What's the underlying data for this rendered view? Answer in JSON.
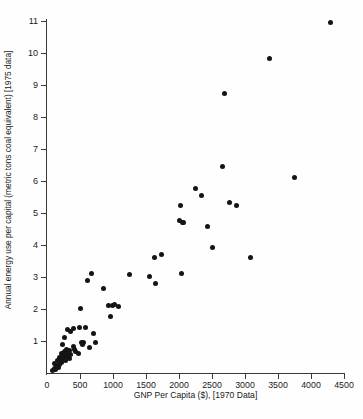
{
  "chart_data": {
    "type": "scatter",
    "title": "",
    "xlabel": "GNP Per Capita ($), [1970 Data]",
    "ylabel": "Annual energy use per capital (metric tons coal equivalent) [1975 data]",
    "xlim": [
      0,
      4500
    ],
    "ylim": [
      0,
      11
    ],
    "xticks": [
      0,
      500,
      1000,
      1500,
      2000,
      2500,
      3000,
      3500,
      4000,
      4500
    ],
    "xtick_labels": [
      "0",
      "500",
      "1000",
      "1500",
      "2000",
      "2500",
      "3000",
      "3500",
      "4000",
      "4500"
    ],
    "yticks": [
      1,
      2,
      3,
      4,
      5,
      6,
      7,
      8,
      9,
      10,
      11
    ],
    "ytick_labels": [
      "1",
      "2",
      "3",
      "4",
      "5",
      "6",
      "7",
      "8",
      "9",
      "10",
      "11"
    ],
    "grid": false,
    "legend": null,
    "marker": {
      "shape": "circle",
      "color": "#141414",
      "size": 5
    },
    "points": [
      {
        "x": 90,
        "y": 0.08
      },
      {
        "x": 110,
        "y": 0.14
      },
      {
        "x": 120,
        "y": 0.3
      },
      {
        "x": 130,
        "y": 0.1
      },
      {
        "x": 150,
        "y": 0.22
      },
      {
        "x": 160,
        "y": 0.38
      },
      {
        "x": 170,
        "y": 0.16
      },
      {
        "x": 185,
        "y": 0.5
      },
      {
        "x": 195,
        "y": 0.28
      },
      {
        "x": 205,
        "y": 0.42
      },
      {
        "x": 215,
        "y": 0.62
      },
      {
        "x": 225,
        "y": 0.34
      },
      {
        "x": 235,
        "y": 0.52
      },
      {
        "x": 240,
        "y": 0.9
      },
      {
        "x": 250,
        "y": 0.46
      },
      {
        "x": 260,
        "y": 0.66
      },
      {
        "x": 265,
        "y": 1.12
      },
      {
        "x": 275,
        "y": 0.56
      },
      {
        "x": 285,
        "y": 0.4
      },
      {
        "x": 295,
        "y": 0.74
      },
      {
        "x": 300,
        "y": 0.6
      },
      {
        "x": 310,
        "y": 1.36
      },
      {
        "x": 315,
        "y": 0.52
      },
      {
        "x": 325,
        "y": 0.64
      },
      {
        "x": 335,
        "y": 0.44
      },
      {
        "x": 345,
        "y": 0.7
      },
      {
        "x": 355,
        "y": 0.58
      },
      {
        "x": 360,
        "y": 1.3
      },
      {
        "x": 395,
        "y": 0.82
      },
      {
        "x": 400,
        "y": 1.38
      },
      {
        "x": 420,
        "y": 0.72
      },
      {
        "x": 430,
        "y": 0.66
      },
      {
        "x": 470,
        "y": 0.6
      },
      {
        "x": 495,
        "y": 1.43
      },
      {
        "x": 510,
        "y": 2.03
      },
      {
        "x": 520,
        "y": 0.95
      },
      {
        "x": 545,
        "y": 0.9
      },
      {
        "x": 560,
        "y": 0.95
      },
      {
        "x": 580,
        "y": 1.42
      },
      {
        "x": 620,
        "y": 2.88
      },
      {
        "x": 650,
        "y": 0.8
      },
      {
        "x": 670,
        "y": 3.11
      },
      {
        "x": 710,
        "y": 1.25
      },
      {
        "x": 735,
        "y": 0.96
      },
      {
        "x": 855,
        "y": 2.64
      },
      {
        "x": 930,
        "y": 2.12
      },
      {
        "x": 955,
        "y": 1.76
      },
      {
        "x": 985,
        "y": 2.1
      },
      {
        "x": 1020,
        "y": 2.13
      },
      {
        "x": 1090,
        "y": 2.09
      },
      {
        "x": 1250,
        "y": 3.08
      },
      {
        "x": 1560,
        "y": 3.02
      },
      {
        "x": 1625,
        "y": 3.61
      },
      {
        "x": 1640,
        "y": 2.79
      },
      {
        "x": 1735,
        "y": 3.71
      },
      {
        "x": 2010,
        "y": 4.76
      },
      {
        "x": 2030,
        "y": 5.22
      },
      {
        "x": 2045,
        "y": 3.11
      },
      {
        "x": 2060,
        "y": 4.71
      },
      {
        "x": 2075,
        "y": 4.7
      },
      {
        "x": 2250,
        "y": 5.76
      },
      {
        "x": 2345,
        "y": 5.55
      },
      {
        "x": 2425,
        "y": 4.58
      },
      {
        "x": 2505,
        "y": 3.93
      },
      {
        "x": 2665,
        "y": 6.46
      },
      {
        "x": 2685,
        "y": 8.72
      },
      {
        "x": 2760,
        "y": 5.34
      },
      {
        "x": 2870,
        "y": 5.24
      },
      {
        "x": 3080,
        "y": 3.62
      },
      {
        "x": 3370,
        "y": 9.84
      },
      {
        "x": 3745,
        "y": 6.11
      },
      {
        "x": 4300,
        "y": 10.96
      }
    ]
  }
}
